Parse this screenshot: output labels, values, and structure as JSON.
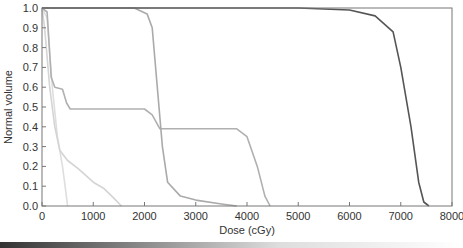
{
  "chart_data": {
    "type": "line",
    "title": "",
    "xlabel": "Dose (cGy)",
    "ylabel": "Normal volume",
    "xlim": [
      0,
      8000
    ],
    "ylim": [
      0.0,
      1.0
    ],
    "x_ticks": [
      "0",
      "1000",
      "2000",
      "3000",
      "4000",
      "5000",
      "6000",
      "7000",
      "8000"
    ],
    "y_ticks": [
      "0.0",
      "0.1",
      "0.2",
      "0.3",
      "0.4",
      "0.5",
      "0.6",
      "0.7",
      "0.8",
      "0.9",
      "1.0"
    ],
    "grid": false,
    "legend": null,
    "series": [
      {
        "name": "target (dark)",
        "color": "#555555",
        "points": [
          [
            0,
            1.0
          ],
          [
            5000,
            1.0
          ],
          [
            6000,
            0.99
          ],
          [
            6500,
            0.96
          ],
          [
            6850,
            0.88
          ],
          [
            7000,
            0.7
          ],
          [
            7200,
            0.4
          ],
          [
            7350,
            0.12
          ],
          [
            7450,
            0.02
          ],
          [
            7550,
            0.0
          ]
        ]
      },
      {
        "name": "organ A",
        "color": "#aaaaaa",
        "points": [
          [
            0,
            1.0
          ],
          [
            1800,
            1.0
          ],
          [
            2050,
            0.97
          ],
          [
            2150,
            0.9
          ],
          [
            2250,
            0.6
          ],
          [
            2350,
            0.3
          ],
          [
            2450,
            0.12
          ],
          [
            2700,
            0.05
          ],
          [
            3000,
            0.03
          ],
          [
            3500,
            0.01
          ],
          [
            3800,
            0.0
          ]
        ]
      },
      {
        "name": "organ B",
        "color": "#b0b0b0",
        "points": [
          [
            0,
            1.0
          ],
          [
            100,
            0.98
          ],
          [
            180,
            0.65
          ],
          [
            250,
            0.6
          ],
          [
            400,
            0.59
          ],
          [
            480,
            0.52
          ],
          [
            550,
            0.49
          ],
          [
            2000,
            0.49
          ],
          [
            2150,
            0.46
          ],
          [
            2300,
            0.39
          ],
          [
            3800,
            0.39
          ],
          [
            4000,
            0.35
          ],
          [
            4200,
            0.2
          ],
          [
            4350,
            0.05
          ],
          [
            4450,
            0.0
          ]
        ]
      },
      {
        "name": "organ C",
        "color": "#d4d4d4",
        "points": [
          [
            0,
            1.0
          ],
          [
            50,
            0.9
          ],
          [
            150,
            0.6
          ],
          [
            250,
            0.4
          ],
          [
            350,
            0.28
          ],
          [
            500,
            0.23
          ],
          [
            700,
            0.19
          ],
          [
            1000,
            0.12
          ],
          [
            1200,
            0.09
          ],
          [
            1400,
            0.04
          ],
          [
            1550,
            0.0
          ]
        ]
      },
      {
        "name": "organ D",
        "color": "#dedede",
        "points": [
          [
            0,
            1.0
          ],
          [
            100,
            0.95
          ],
          [
            200,
            0.6
          ],
          [
            300,
            0.35
          ],
          [
            400,
            0.2
          ],
          [
            450,
            0.1
          ],
          [
            500,
            0.0
          ]
        ]
      }
    ]
  }
}
